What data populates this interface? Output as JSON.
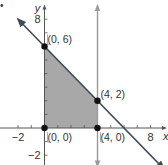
{
  "problem_marker": "•",
  "chart_data": {
    "type": "line",
    "title": "",
    "xlabel": "x",
    "ylabel": "y",
    "xlim": [
      -3.3,
      9.3
    ],
    "ylim": [
      -2.8,
      9.3
    ],
    "x_tick_values": [
      -2,
      -1,
      1,
      2,
      3,
      4,
      5,
      6,
      7,
      8
    ],
    "y_tick_values": [
      -2,
      -1,
      1,
      2,
      3,
      4,
      5,
      6,
      7,
      8
    ],
    "x_tick_labels": [
      {
        "value": -2,
        "label": "−2"
      },
      {
        "value": 8,
        "label": "8"
      }
    ],
    "y_tick_labels": [
      {
        "value": 8,
        "label": "8"
      },
      {
        "value": -2,
        "label": "−2"
      }
    ],
    "grid": false,
    "lines": [
      {
        "name": "x + y = 6",
        "points": [
          [
            -2,
            8
          ],
          [
            9,
            -3
          ]
        ],
        "color": "#3d4b5a",
        "arrows": "both"
      },
      {
        "name": "x = 4",
        "points": [
          [
            4,
            9.3
          ],
          [
            4,
            -2.8
          ]
        ],
        "color": "#9a9a9a",
        "arrows": "both"
      }
    ],
    "shaded_region": {
      "name": "feasible-region",
      "vertices": [
        [
          0,
          0
        ],
        [
          0,
          6
        ],
        [
          4,
          2
        ],
        [
          4,
          0
        ]
      ],
      "color": "#a8a8a8"
    },
    "points": [
      {
        "x": 0,
        "y": 6,
        "label": "(0, 6)"
      },
      {
        "x": 4,
        "y": 2,
        "label": "(4, 2)"
      },
      {
        "x": 0,
        "y": 0,
        "label": "(0, 0)"
      },
      {
        "x": 4,
        "y": 0,
        "label": "(4, 0)"
      }
    ],
    "colors": {
      "axis": "#555555",
      "point": "#111111",
      "text": "#333333"
    }
  }
}
